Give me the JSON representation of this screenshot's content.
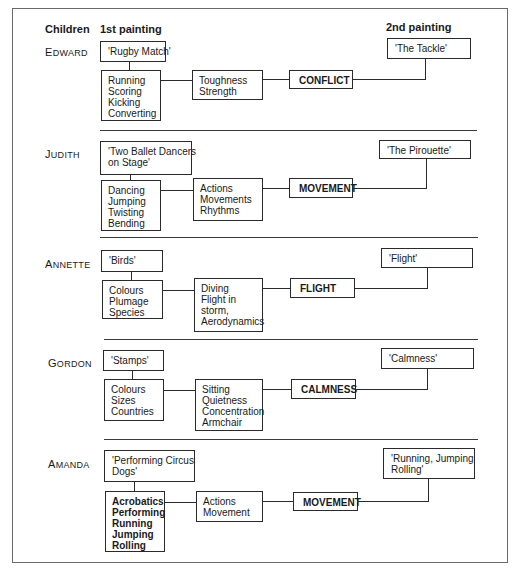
{
  "headers": {
    "children": "Children",
    "first_painting": "1st painting",
    "second_painting": "2nd painting"
  },
  "rows": [
    {
      "child": "Edward",
      "child_initial": "E",
      "child_rest": "DWARD",
      "first_painting": [
        "'Rugby Match'"
      ],
      "activities": [
        "Running",
        "Scoring",
        "Kicking",
        "Converting"
      ],
      "qualities": [
        "Toughness",
        "Strength"
      ],
      "theme": "CONFLICT",
      "second_painting": [
        "'The Tackle'"
      ]
    },
    {
      "child": "Judith",
      "child_initial": "J",
      "child_rest": "UDITH",
      "first_painting": [
        "'Two Ballet Dancers",
        "on Stage'"
      ],
      "activities": [
        "Dancing",
        "Jumping",
        "Twisting",
        "Bending"
      ],
      "qualities": [
        "Actions",
        "Movements",
        "Rhythms"
      ],
      "theme": "MOVEMENT",
      "second_painting": [
        "'The Pirouette'"
      ]
    },
    {
      "child": "Annette",
      "child_initial": "A",
      "child_rest": "NNETTE",
      "first_painting": [
        "'Birds'"
      ],
      "activities": [
        "Colours",
        "Plumage",
        "Species"
      ],
      "qualities": [
        "Diving",
        "Flight in",
        "storm,",
        "Aerodynamics"
      ],
      "theme": "FLIGHT",
      "second_painting": [
        "'Flight'"
      ]
    },
    {
      "child": "Gordon",
      "child_initial": "G",
      "child_rest": "ORDON",
      "first_painting": [
        "'Stamps'"
      ],
      "activities": [
        "Colours",
        "Sizes",
        "Countries"
      ],
      "qualities": [
        "Sitting",
        "Quietness",
        "Concentration",
        "Armchair"
      ],
      "theme": "CALMNESS",
      "second_painting": [
        "'Calmness'"
      ]
    },
    {
      "child": "Amanda",
      "child_initial": "A",
      "child_rest": "MANDA",
      "first_painting": [
        "'Performing Circus",
        "Dogs'"
      ],
      "activities": [
        "Acrobatics",
        "Performing",
        "Running",
        "Jumping",
        "Rolling"
      ],
      "qualities": [
        "Actions",
        "Movement"
      ],
      "theme": "MOVEMENT",
      "second_painting": [
        "'Running, Jumping",
        "Rolling'"
      ]
    }
  ]
}
